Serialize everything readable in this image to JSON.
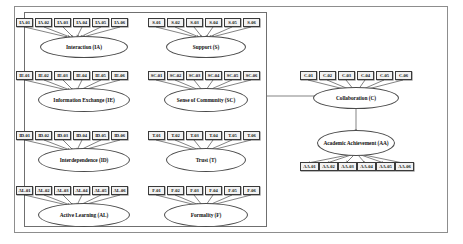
{
  "diagram": {
    "type": "path-diagram",
    "constructs": [
      {
        "id": "IA",
        "label": "Interaction (IA)",
        "indicators": [
          "IA-01",
          "IA-02",
          "IA-03",
          "IA-04",
          "IA-05",
          "IA-06"
        ],
        "group": "exogenous"
      },
      {
        "id": "S",
        "label": "Support (S)",
        "indicators": [
          "S-01",
          "S-02",
          "S-03",
          "S-04",
          "S-05",
          "S-06"
        ],
        "group": "exogenous"
      },
      {
        "id": "IE",
        "label": "Information Exchange (IE)",
        "indicators": [
          "IE-01",
          "IE-02",
          "IE-03",
          "IE-04",
          "IE-05",
          "IE-06"
        ],
        "group": "exogenous"
      },
      {
        "id": "SC",
        "label": "Sense of Community (SC)",
        "indicators": [
          "SC-01",
          "SC-02",
          "SC-03",
          "SC-04",
          "SC-05",
          "SC-06"
        ],
        "group": "exogenous"
      },
      {
        "id": "ID",
        "label": "Interdependence (ID)",
        "indicators": [
          "ID-01",
          "ID-02",
          "ID-03",
          "ID-04",
          "ID-05",
          "ID-06"
        ],
        "group": "exogenous"
      },
      {
        "id": "T",
        "label": "Trust (T)",
        "indicators": [
          "T-01",
          "T-02",
          "T-03",
          "T-04",
          "T-05",
          "T-06"
        ],
        "group": "exogenous"
      },
      {
        "id": "AL",
        "label": "Active Learning (AL)",
        "indicators": [
          "AL-01",
          "AL-02",
          "AL-03",
          "AL-04",
          "AL-05",
          "AL-06"
        ],
        "group": "exogenous"
      },
      {
        "id": "F",
        "label": "Formality (F)",
        "indicators": [
          "F-01",
          "F-02",
          "F-03",
          "F-04",
          "F-05",
          "F-06"
        ],
        "group": "exogenous"
      },
      {
        "id": "C",
        "label": "Collaboration (C)",
        "indicators": [
          "C-01",
          "C-02",
          "C-03",
          "C-04",
          "C-05",
          "C-06"
        ],
        "group": "mediator"
      },
      {
        "id": "AA",
        "label": "Academic Achievement (AA)",
        "indicators": [
          "AA-01",
          "AA-02",
          "AA-03",
          "AA-04",
          "AA-05",
          "AA-06"
        ],
        "group": "endogenous"
      }
    ],
    "structural_paths": [
      {
        "from": "exogenous-group",
        "to": "C",
        "direction": "right"
      },
      {
        "from": "C",
        "to": "AA",
        "direction": "down"
      }
    ],
    "colors": {
      "stroke": "#2f2f2f",
      "indicator_fill": "#f2f2f2",
      "ellipse_fill": "#ffffff",
      "frame": "#8d8d8d"
    }
  }
}
